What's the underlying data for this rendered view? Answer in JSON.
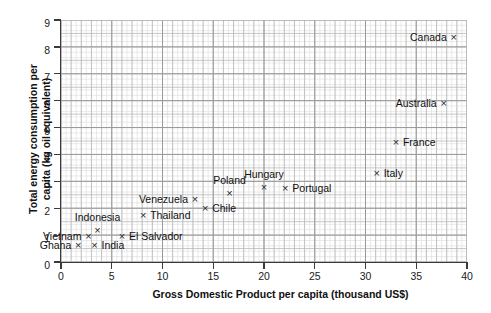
{
  "chart_data": {
    "type": "scatter",
    "title": "",
    "xlabel": "Gross Domestic Product per capita (thousand US$)",
    "ylabel_line1": "Total energy consumption per",
    "ylabel_line2": "capita (kg oil equivalent)",
    "xlim": [
      0,
      40
    ],
    "ylim": [
      0,
      9
    ],
    "xticks": [
      0,
      5,
      10,
      15,
      20,
      25,
      30,
      35,
      40
    ],
    "yticks": [
      0,
      1,
      2,
      3,
      4,
      5,
      6,
      7,
      8,
      9
    ],
    "grid": true,
    "grid_minor": true,
    "legend": "none",
    "marker": "×",
    "points": [
      {
        "label": "Ghana",
        "x": 1.7,
        "y": 0.65,
        "label_pos": "left"
      },
      {
        "label": "Vietnam",
        "x": 2.7,
        "y": 0.95,
        "label_pos": "left"
      },
      {
        "label": "India",
        "x": 3.3,
        "y": 0.65,
        "label_pos": "right"
      },
      {
        "label": "Indonesia",
        "x": 3.6,
        "y": 1.2,
        "label_pos": "above"
      },
      {
        "label": "El Salvador",
        "x": 6.0,
        "y": 0.95,
        "label_pos": "right"
      },
      {
        "label": "Thailand",
        "x": 8.1,
        "y": 1.75,
        "label_pos": "right"
      },
      {
        "label": "Venezuela",
        "x": 13.2,
        "y": 2.35,
        "label_pos": "left"
      },
      {
        "label": "Chile",
        "x": 14.2,
        "y": 2.0,
        "label_pos": "right"
      },
      {
        "label": "Poland",
        "x": 16.6,
        "y": 2.55,
        "label_pos": "above"
      },
      {
        "label": "Hungary",
        "x": 20.0,
        "y": 2.8,
        "label_pos": "above"
      },
      {
        "label": "Portugal",
        "x": 22.1,
        "y": 2.75,
        "label_pos": "right"
      },
      {
        "label": "Italy",
        "x": 31.1,
        "y": 3.3,
        "label_pos": "right"
      },
      {
        "label": "France",
        "x": 33.0,
        "y": 4.45,
        "label_pos": "right"
      },
      {
        "label": "Australia",
        "x": 37.7,
        "y": 5.9,
        "label_pos": "left"
      },
      {
        "label": "Canada",
        "x": 38.7,
        "y": 8.35,
        "label_pos": "left"
      }
    ],
    "colors": {
      "marker": "#2b2b2b",
      "text": "#111111",
      "axis": "#3a3a3a",
      "grid_major": "#b8b8b8",
      "grid_minor": "#dcdcdc",
      "background": "#ffffff"
    }
  }
}
